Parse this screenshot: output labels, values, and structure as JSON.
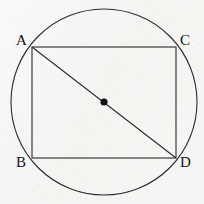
{
  "figure": {
    "background_color": "#f6f5f3",
    "stroke_color": "#2b2b2b",
    "label_color": "#121212",
    "canvas": {
      "width": 204,
      "height": 204
    }
  },
  "circle": {
    "name": "circumscribed-circle",
    "center_x": 104,
    "center_y": 102,
    "radius": 93,
    "stroke_width": 1.1
  },
  "center_point": {
    "name": "circle-center-dot",
    "x": 104,
    "y": 102,
    "radius": 3.6,
    "fill": "#111111"
  },
  "rectangle": {
    "name": "inscribed-rectangle",
    "left": 32,
    "top": 47,
    "right": 176,
    "bottom": 158,
    "stroke_width": 1.1
  },
  "diagonal": {
    "name": "diagonal-A-to-D",
    "x1": 32,
    "y1": 47,
    "x2": 176,
    "y2": 158,
    "stroke_width": 1.1
  },
  "vertices": [
    {
      "id": "A",
      "label": "A",
      "point_x": 32,
      "point_y": 47,
      "label_x": 16,
      "label_y": 33
    },
    {
      "id": "C",
      "label": "C",
      "point_x": 176,
      "point_y": 47,
      "label_x": 180,
      "label_y": 33
    },
    {
      "id": "B",
      "label": "B",
      "point_x": 32,
      "point_y": 158,
      "label_x": 16,
      "label_y": 155
    },
    {
      "id": "D",
      "label": "D",
      "point_x": 176,
      "point_y": 158,
      "label_x": 180,
      "label_y": 155
    }
  ]
}
